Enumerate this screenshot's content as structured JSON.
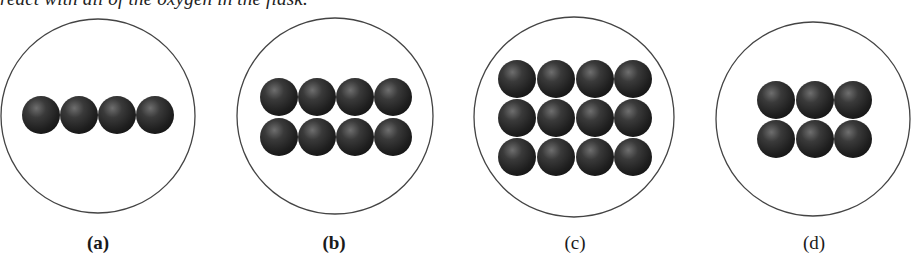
{
  "caption_fragment": "react with all of the oxygen in the flask.",
  "colors": {
    "background": "#ffffff",
    "flask_outline": "#444444",
    "molecule_dark": "#1c1c1c",
    "molecule_mid": "#3a3a3a",
    "molecule_highlight": "#6e6e6e"
  },
  "panels": [
    {
      "label": "(a)",
      "circle": {
        "cx": 98,
        "cy": 116,
        "r": 97
      },
      "rows": 1,
      "cols": 4,
      "sphere_centers_x": [
        41,
        79,
        117,
        155
      ],
      "sphere_centers_y": [
        115
      ],
      "sphere_count": 4,
      "label_x": 98
    },
    {
      "label": "(b)",
      "circle": {
        "cx": 335,
        "cy": 116,
        "r": 98
      },
      "rows": 2,
      "cols": 4,
      "sphere_centers_x": [
        279,
        317,
        355,
        393
      ],
      "sphere_centers_y": [
        97,
        137
      ],
      "sphere_count": 8,
      "label_x": 334
    },
    {
      "label": "(c)",
      "circle": {
        "cx": 574,
        "cy": 117,
        "r": 100
      },
      "rows": 3,
      "cols": 4,
      "sphere_centers_x": [
        517,
        556,
        595,
        633
      ],
      "sphere_centers_y": [
        79,
        118,
        157
      ],
      "sphere_count": 12,
      "label_x": 575
    },
    {
      "label": "(d)",
      "circle": {
        "cx": 813,
        "cy": 119,
        "r": 97
      },
      "rows": 2,
      "cols": 3,
      "sphere_centers_x": [
        776,
        815,
        853
      ],
      "sphere_centers_y": [
        100,
        139
      ],
      "sphere_count": 6,
      "label_x": 814
    }
  ],
  "sphere_radius": 19,
  "label_y": 232
}
